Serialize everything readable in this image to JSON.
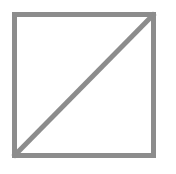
{
  "figure": {
    "shape": "square-with-diagonal",
    "stroke_color": "#8c8c8c",
    "background_color": "#ffffff",
    "box": {
      "x": 14,
      "y": 14,
      "width": 140,
      "height": 142
    },
    "diagonal": {
      "from": "bottom-left",
      "to": "top-right"
    },
    "stroke_width": 5
  }
}
